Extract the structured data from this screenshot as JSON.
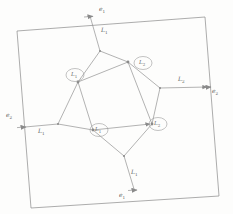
{
  "figure": {
    "name": "graph-on-torus-fundamental-domain",
    "background_color": "#fdfdfc",
    "stroke_color": "#8a8a8a",
    "text_color": "#5d5d5d"
  },
  "boundary": {
    "name": "outer-square",
    "corners": [
      [
        17,
        31
      ],
      [
        205,
        17
      ],
      [
        219,
        196
      ],
      [
        31,
        208
      ]
    ]
  },
  "edge_markers": [
    {
      "id": "e1-top",
      "label": "e",
      "sub": "1",
      "x": 96,
      "y": 11,
      "arrow_at": [
        90,
        16
      ],
      "arrow_dir": "right"
    },
    {
      "id": "e2-right",
      "label": "e",
      "sub": "2",
      "x": 213,
      "y": 93,
      "arrow_at": [
        209,
        87
      ],
      "arrow_dir": "right"
    },
    {
      "id": "e2-left",
      "label": "e",
      "sub": "2",
      "x": 9,
      "y": 117,
      "arrow_at": [
        23,
        127
      ],
      "arrow_dir": "right"
    },
    {
      "id": "e1-bottom",
      "label": "e",
      "sub": "1",
      "x": 122,
      "y": 196,
      "arrow_at": [
        135,
        190
      ],
      "arrow_dir": "right"
    }
  ],
  "edge_labels": [
    {
      "id": "L1-top",
      "label": "L",
      "sub": "1",
      "x": 99,
      "y": 31
    },
    {
      "id": "L2-right",
      "label": "L",
      "sub": "2",
      "x": 180,
      "y": 81
    },
    {
      "id": "L1-left",
      "label": "L",
      "sub": "1",
      "x": 40,
      "y": 129
    },
    {
      "id": "L1-bottom",
      "label": "L",
      "sub": "1",
      "x": 133,
      "y": 173
    }
  ],
  "vertices": [
    {
      "id": "v-L1-upper-left",
      "label": "L",
      "sub": "1",
      "cx": 73,
      "cy": 75,
      "node": [
        78,
        82
      ],
      "r": 8.5
    },
    {
      "id": "v-L2-upper-right",
      "label": "L",
      "sub": "2",
      "cx": 145,
      "cy": 66,
      "node": [
        128,
        62
      ],
      "r": 8.5
    },
    {
      "id": "v-L1-lower-left",
      "label": "L",
      "sub": "1",
      "cx": 100,
      "cy": 131,
      "node": [
        93,
        130
      ],
      "r": 8.5
    },
    {
      "id": "v-L2-lower-right",
      "label": "L",
      "sub": "2",
      "cx": 158,
      "cy": 126,
      "node": [
        152,
        124
      ],
      "r": 8.5
    }
  ],
  "junction_nodes": [
    {
      "id": "j-top",
      "x": 100,
      "y": 51
    },
    {
      "id": "j-right",
      "x": 160,
      "y": 88
    },
    {
      "id": "j-left",
      "x": 58,
      "y": 124
    },
    {
      "id": "j-bottom",
      "x": 124,
      "y": 156
    }
  ],
  "inner_quadrilateral": {
    "name": "inner-quad",
    "points": [
      [
        78,
        82
      ],
      [
        128,
        62
      ],
      [
        152,
        124
      ],
      [
        93,
        130
      ]
    ]
  },
  "arcs": [
    {
      "id": "arc-top-e1",
      "from": [
        90,
        16
      ],
      "to": [
        100,
        51
      ]
    },
    {
      "id": "arc-top-left",
      "from": [
        100,
        51
      ],
      "to": [
        78,
        82
      ]
    },
    {
      "id": "arc-top-right",
      "from": [
        100,
        51
      ],
      "to": [
        128,
        62
      ]
    },
    {
      "id": "arc-right-e2",
      "from": [
        209,
        87
      ],
      "to": [
        160,
        88
      ]
    },
    {
      "id": "arc-right-up",
      "from": [
        160,
        88
      ],
      "to": [
        128,
        62
      ]
    },
    {
      "id": "arc-right-down",
      "from": [
        160,
        88
      ],
      "to": [
        152,
        124
      ]
    },
    {
      "id": "arc-left-e2",
      "from": [
        23,
        127
      ],
      "to": [
        58,
        124
      ]
    },
    {
      "id": "arc-left-up",
      "from": [
        58,
        124
      ],
      "to": [
        78,
        82
      ]
    },
    {
      "id": "arc-left-down",
      "from": [
        58,
        124
      ],
      "to": [
        93,
        130
      ]
    },
    {
      "id": "arc-bottom-e1",
      "from": [
        135,
        190
      ],
      "to": [
        124,
        156
      ]
    },
    {
      "id": "arc-bottom-left",
      "from": [
        124,
        156
      ],
      "to": [
        93,
        130
      ]
    },
    {
      "id": "arc-bottom-right",
      "from": [
        124,
        156
      ],
      "to": [
        152,
        124
      ]
    }
  ]
}
